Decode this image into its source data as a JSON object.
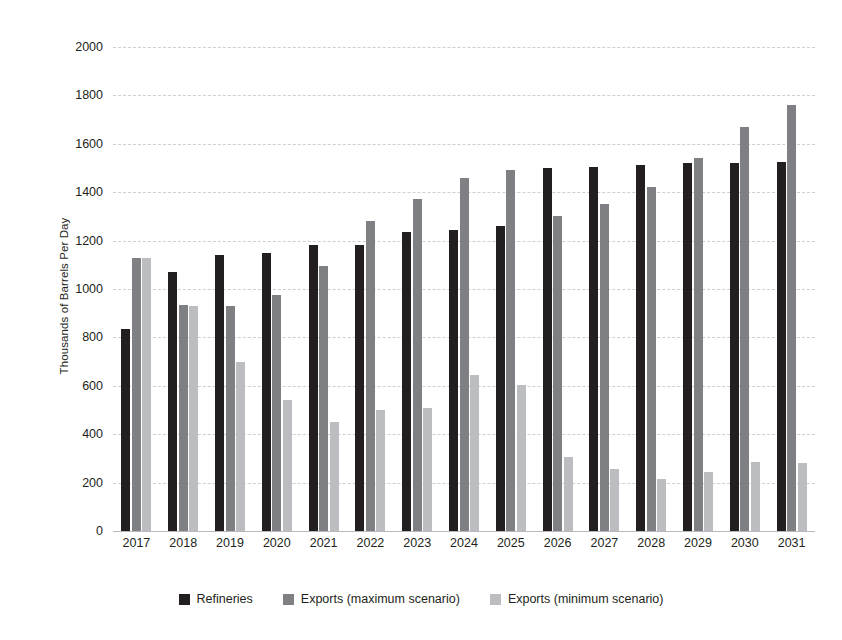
{
  "chart_data": {
    "type": "bar",
    "title": "",
    "subtitle": "",
    "xlabel": "",
    "ylabel": "Thousands of Barrels Per Day",
    "ylim": [
      0,
      2000
    ],
    "yticks": [
      0,
      200,
      400,
      600,
      800,
      1000,
      1200,
      1400,
      1600,
      1800,
      2000
    ],
    "ytick_labels": [
      "0",
      "200",
      "400",
      "600",
      "800",
      "1000",
      "1200",
      "1400",
      "1600",
      "1800",
      "2000"
    ],
    "grid": true,
    "legend_position": "bottom",
    "categories": [
      "2017",
      "2018",
      "2019",
      "2020",
      "2021",
      "2022",
      "2023",
      "2024",
      "2025",
      "2026",
      "2027",
      "2028",
      "2029",
      "2030",
      "2031"
    ],
    "series": [
      {
        "name": "Refineries",
        "color": "#231f20",
        "values": [
          835,
          1070,
          1140,
          1150,
          1180,
          1180,
          1235,
          1245,
          1260,
          1500,
          1505,
          1512,
          1520,
          1522,
          1525
        ]
      },
      {
        "name": "Exports (maximum scenario)",
        "color": "#7f8083",
        "values": [
          1130,
          935,
          930,
          975,
          1095,
          1280,
          1370,
          1460,
          1490,
          1300,
          1350,
          1420,
          1540,
          1670,
          1760
        ]
      },
      {
        "name": "Exports (minimum scenario)",
        "color": "#bcbdc0",
        "values": [
          1130,
          930,
          700,
          540,
          450,
          500,
          510,
          645,
          605,
          305,
          255,
          215,
          245,
          285,
          280
        ]
      }
    ]
  }
}
